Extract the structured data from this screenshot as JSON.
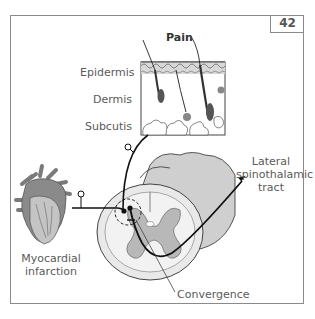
{
  "figure": {
    "page_number": "42",
    "labels": {
      "pain": "Pain",
      "epidermis": "Epidermis",
      "dermis": "Dermis",
      "subcutis": "Subcutis",
      "lateral_line1": "Lateral",
      "lateral_line2": "spinothalamic",
      "lateral_line3": "tract",
      "mi_line1": "Myocardial",
      "mi_line2": "infarction",
      "convergence": "Convergence"
    },
    "colors": {
      "heart_dark": "#7a7a7a",
      "heart_light": "#bdbdbd",
      "cord_white_matter": "#c8c8c8",
      "cord_gray_matter": "#a9a9a9",
      "cord_light": "#e6e6e6",
      "line": "#1a1a1a"
    }
  }
}
